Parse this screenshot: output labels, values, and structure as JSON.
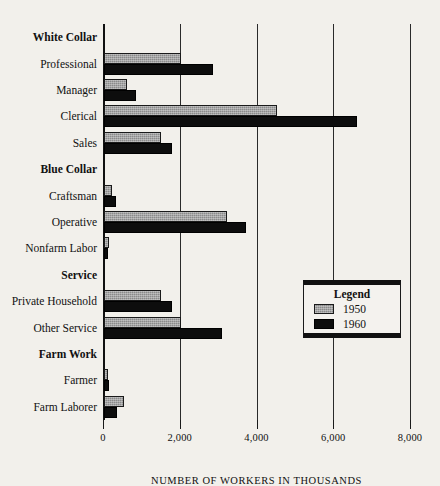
{
  "chart_data": {
    "type": "bar",
    "orientation": "horizontal",
    "title": "",
    "xlabel": "NUMBER OF WORKERS IN THOUSANDS",
    "ylabel": "",
    "xlim": [
      0,
      8000
    ],
    "xticks": [
      0,
      2000,
      4000,
      6000,
      8000
    ],
    "xtick_labels": [
      "0",
      "2,000",
      "4,000",
      "6,000",
      "8,000"
    ],
    "grid": "vertical-major",
    "legend": {
      "title": "Legend",
      "position": "center-right-inside",
      "entries": [
        {
          "name": "1950",
          "color": "#8a8a8a",
          "pattern": "stippled-gray"
        },
        {
          "name": "1960",
          "color": "#0d0d0d",
          "pattern": "solid-black"
        }
      ]
    },
    "categories": [
      "Professional",
      "Manager",
      "Clerical",
      "Sales",
      "Craftsman",
      "Operative",
      "Nonfarm Labor",
      "Private Household",
      "Other Service",
      "Farmer",
      "Farm Laborer"
    ],
    "groups": [
      {
        "label": "White Collar",
        "categories": [
          "Professional",
          "Manager",
          "Clerical",
          "Sales"
        ]
      },
      {
        "label": "Blue Collar",
        "categories": [
          "Craftsman",
          "Operative",
          "Nonfarm Labor"
        ]
      },
      {
        "label": "Service",
        "categories": [
          "Private Household",
          "Other Service"
        ]
      },
      {
        "label": "Farm Work",
        "categories": [
          "Farmer",
          "Farm Laborer"
        ]
      }
    ],
    "series": [
      {
        "name": "1950",
        "values": [
          2000,
          600,
          4500,
          1480,
          210,
          3200,
          130,
          1480,
          2000,
          110,
          510
        ]
      },
      {
        "name": "1960",
        "values": [
          2840,
          830,
          6600,
          1780,
          320,
          3700,
          110,
          1780,
          3080,
          130,
          340
        ]
      }
    ]
  },
  "rows": [
    {
      "label": "White Collar",
      "type": "group",
      "v1950": null,
      "v1960": null
    },
    {
      "label": "Professional",
      "type": "item",
      "v1950": 2000,
      "v1960": 2840
    },
    {
      "label": "Manager",
      "type": "item",
      "v1950": 600,
      "v1960": 830
    },
    {
      "label": "Clerical",
      "type": "item",
      "v1950": 4500,
      "v1960": 6600
    },
    {
      "label": "Sales",
      "type": "item",
      "v1950": 1480,
      "v1960": 1780
    },
    {
      "label": "Blue Collar",
      "type": "group",
      "v1950": null,
      "v1960": null
    },
    {
      "label": "Craftsman",
      "type": "item",
      "v1950": 210,
      "v1960": 320
    },
    {
      "label": "Operative",
      "type": "item",
      "v1950": 3200,
      "v1960": 3700
    },
    {
      "label": "Nonfarm Labor",
      "type": "item",
      "v1950": 130,
      "v1960": 110
    },
    {
      "label": "Service",
      "type": "group",
      "v1950": null,
      "v1960": null
    },
    {
      "label": "Private Household",
      "type": "item",
      "v1950": 1480,
      "v1960": 1780
    },
    {
      "label": "Other Service",
      "type": "item",
      "v1950": 2000,
      "v1960": 3080
    },
    {
      "label": "Farm Work",
      "type": "group",
      "v1950": null,
      "v1960": null
    },
    {
      "label": "Farmer",
      "type": "item",
      "v1950": 110,
      "v1960": 130
    },
    {
      "label": "Farm Laborer",
      "type": "item",
      "v1950": 510,
      "v1960": 340
    }
  ]
}
